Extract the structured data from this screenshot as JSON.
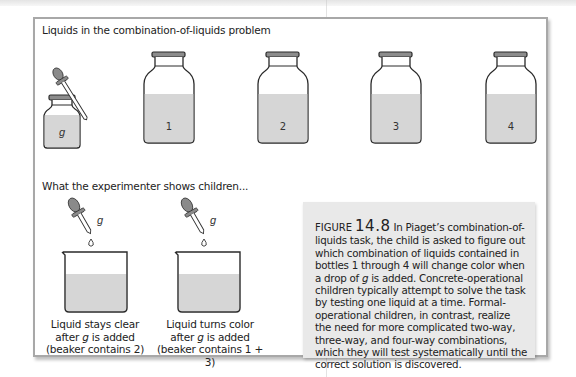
{
  "figure": {
    "title": "Liquids in the combination-of-liquids problem",
    "subtitle": "What the experimenter shows children...",
    "bottles": [
      {
        "label": "g",
        "kind": "dropper-bottle"
      },
      {
        "label": "1",
        "kind": "bottle"
      },
      {
        "label": "2",
        "kind": "bottle"
      },
      {
        "label": "3",
        "kind": "bottle"
      },
      {
        "label": "4",
        "kind": "bottle"
      }
    ],
    "demonstrations": [
      {
        "dropper_label": "g",
        "caption_line1": "Liquid stays clear",
        "caption_line2_pre": "after ",
        "caption_line2_var": "g",
        "caption_line2_post": " is added",
        "caption_line3": "(beaker contains 2)"
      },
      {
        "dropper_label": "g",
        "caption_line1": "Liquid turns color",
        "caption_line2_pre": "after ",
        "caption_line2_var": "g",
        "caption_line2_post": " is added",
        "caption_line3": "(beaker contains 1 + 3)"
      }
    ],
    "caption": {
      "label": "FIGURE",
      "number": "14.8",
      "text_pre": " In Piaget’s combination-of-liquids task, the child is asked to figure out which combination of liquids contained in bottles 1 through 4 will change color when a drop of ",
      "text_var": "g",
      "text_post": " is added. Concrete-operational children typically attempt to solve the task by testing one liquid at a time. Formal-operational children, in contrast, realize the need for more complicated two-way, three-way, and four-way combinations, which they will test systematically until the correct solution is discovered."
    },
    "colors": {
      "liquid": "#d6d6d6",
      "outline": "#2a2a2a",
      "caption_bg": "#e9e9e9",
      "frame": "#a8a8a8",
      "dropper_bulb": "#8a8a8a"
    }
  }
}
